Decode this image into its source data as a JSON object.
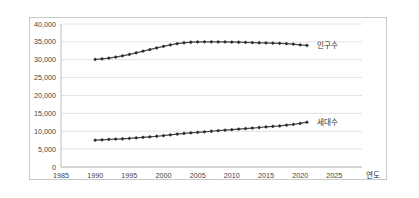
{
  "chart_data": {
    "type": "line",
    "title": "",
    "xlabel": "연도",
    "ylabel": "",
    "xlim": [
      1985,
      2027
    ],
    "ylim": [
      0,
      40000
    ],
    "grid": true,
    "legend_position": "right-inline",
    "x_ticks": [
      "1985",
      "1990",
      "1995",
      "2000",
      "2005",
      "2010",
      "2015",
      "2020",
      "2025"
    ],
    "x_tick_values": [
      1985,
      1990,
      1995,
      2000,
      2005,
      2010,
      2015,
      2020,
      2025
    ],
    "y_ticks": [
      "0",
      "5,000",
      "10,000",
      "15,000",
      "20,000",
      "25,000",
      "30,000",
      "35,000",
      "40,000"
    ],
    "y_tick_values": [
      0,
      5000,
      10000,
      15000,
      20000,
      25000,
      30000,
      35000,
      40000
    ],
    "x": [
      1990,
      1991,
      1992,
      1993,
      1994,
      1995,
      1996,
      1997,
      1998,
      1999,
      2000,
      2001,
      2002,
      2003,
      2004,
      2005,
      2006,
      2007,
      2008,
      2009,
      2010,
      2011,
      2012,
      2013,
      2014,
      2015,
      2016,
      2017,
      2018,
      2019,
      2020,
      2021
    ],
    "series": [
      {
        "name": "인구수",
        "color": "#3f3f3f",
        "marker": "diamond",
        "values": [
          30100,
          30250,
          30450,
          30750,
          31100,
          31500,
          31950,
          32400,
          32850,
          33300,
          33750,
          34150,
          34500,
          34750,
          34900,
          35000,
          35020,
          35020,
          35000,
          34980,
          34950,
          34900,
          34850,
          34800,
          34750,
          34700,
          34650,
          34600,
          34500,
          34350,
          34150,
          34000
        ]
      },
      {
        "name": "세대수",
        "color": "#3f3f3f",
        "marker": "diamond",
        "values": [
          7500,
          7600,
          7700,
          7800,
          7900,
          8000,
          8150,
          8300,
          8450,
          8600,
          8800,
          9000,
          9200,
          9400,
          9550,
          9700,
          9850,
          10000,
          10150,
          10300,
          10450,
          10600,
          10750,
          10900,
          11050,
          11200,
          11350,
          11500,
          11700,
          11900,
          12200,
          12550
        ]
      }
    ],
    "annotations": [
      {
        "name": "인구수",
        "text": "인구수"
      },
      {
        "name": "세대수",
        "text": "세대수"
      }
    ]
  },
  "axis_titles": {
    "x": "연도"
  }
}
